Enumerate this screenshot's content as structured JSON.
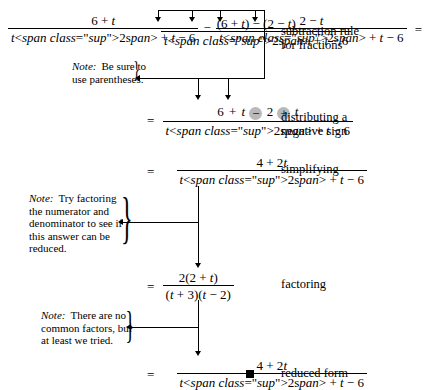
{
  "document": {
    "type": "algebra-derivation",
    "topic": "subtracting rational expressions"
  },
  "steps": [
    {
      "id": "start",
      "lhs_fraction_1": {
        "numerator": "6 + t",
        "denominator": "t² + t − 6"
      },
      "operator": "−",
      "lhs_fraction_2": {
        "numerator": "2 − t",
        "denominator": "t² + t − 6"
      },
      "equals": "=",
      "result": {
        "numerator": "(6 + t) − (2 − t)",
        "denominator": "t² + t − 6"
      },
      "label": "subtraction rule for fractions",
      "label_line_1": "subtraction rule",
      "label_line_2": "for fractions"
    },
    {
      "id": "distribute",
      "equals": "=",
      "numerator_parts": [
        "6",
        "+",
        "t",
        "−",
        "2",
        "+",
        "t"
      ],
      "numerator": "6 + t − 2 + t",
      "denominator": "t² + t − 6",
      "highlighted_signs": [
        "−",
        "+"
      ],
      "label": "distributing a negative sign",
      "label_line_1": "distributing a",
      "label_line_2": "negative sign"
    },
    {
      "id": "simplify",
      "equals": "=",
      "numerator": "4 + 2t",
      "denominator": "t² + t − 6",
      "label": "simplifying",
      "label_line_1": "simplifying",
      "label_line_2": ""
    },
    {
      "id": "factor",
      "equals": "=",
      "numerator": "2(2 + t)",
      "denominator": "(t + 3)(t − 2)",
      "label": "factoring",
      "label_line_1": "factoring",
      "label_line_2": ""
    },
    {
      "id": "reduced",
      "equals": "=",
      "numerator": "4 + 2t",
      "denominator": "t² + t − 6",
      "qed": "■",
      "label": "reduced form",
      "label_line_1": "reduced form",
      "label_line_2": ""
    }
  ],
  "notes": [
    {
      "id": "note-parentheses",
      "word": "Note:",
      "lines": [
        "Be sure to",
        "use parentheses."
      ]
    },
    {
      "id": "note-factoring",
      "word": "Note:",
      "lines": [
        "Try factoring",
        "the numerator and",
        "denominator to see if",
        "this answer can be",
        "reduced."
      ]
    },
    {
      "id": "note-common-factors",
      "word": "Note:",
      "lines": [
        "There are no",
        "common factors, but",
        "at least we tried."
      ]
    }
  ],
  "colors": {
    "ink": "#000000",
    "background": "#ffffff",
    "highlight": "#b9b9b9"
  }
}
